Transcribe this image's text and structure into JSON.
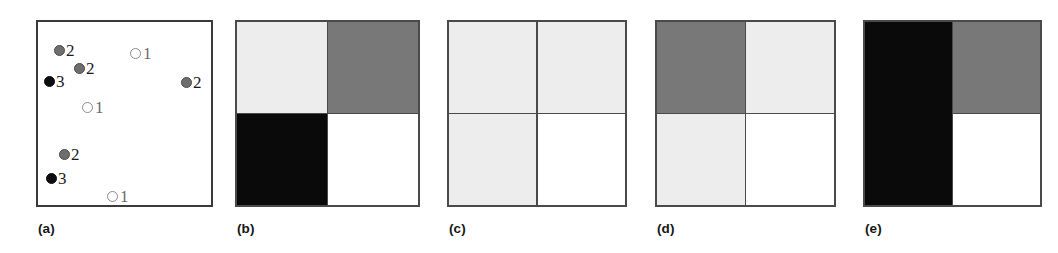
{
  "figure": {
    "panels": [
      {
        "id": "a",
        "caption": "(a)",
        "type": "scatter",
        "points": [
          {
            "label": "2",
            "marker": "gray-filled-circle",
            "x": 16,
            "y": 20
          },
          {
            "label": "1",
            "marker": "hollow-circle",
            "x": 92,
            "y": 23
          },
          {
            "label": "2",
            "marker": "gray-filled-circle",
            "x": 36,
            "y": 38
          },
          {
            "label": "3",
            "marker": "black-filled-circle",
            "x": 6,
            "y": 51
          },
          {
            "label": "2",
            "marker": "gray-filled-circle",
            "x": 143,
            "y": 52
          },
          {
            "label": "1",
            "marker": "hollow-circle",
            "x": 44,
            "y": 77
          },
          {
            "label": "2",
            "marker": "gray-filled-circle",
            "x": 21,
            "y": 124
          },
          {
            "label": "3",
            "marker": "black-filled-circle",
            "x": 8,
            "y": 148
          },
          {
            "label": "1",
            "marker": "hollow-circle",
            "x": 69,
            "y": 166
          }
        ]
      },
      {
        "id": "b",
        "caption": "(b)",
        "type": "quadrant-grid",
        "cells": [
          {
            "position": "top-left",
            "fill": "light-gray",
            "color": "#ededed"
          },
          {
            "position": "top-right",
            "fill": "medium-gray",
            "color": "#787878"
          },
          {
            "position": "bottom-left",
            "fill": "black",
            "color": "#0a0a0a"
          },
          {
            "position": "bottom-right",
            "fill": "white",
            "color": "#ffffff"
          }
        ]
      },
      {
        "id": "c",
        "caption": "(c)",
        "type": "quadrant-grid",
        "cells": [
          {
            "position": "top-left",
            "fill": "light-gray",
            "color": "#ededed"
          },
          {
            "position": "top-right",
            "fill": "light-gray",
            "color": "#ededed"
          },
          {
            "position": "bottom-left",
            "fill": "light-gray",
            "color": "#ededed"
          },
          {
            "position": "bottom-right",
            "fill": "white",
            "color": "#ffffff"
          }
        ]
      },
      {
        "id": "d",
        "caption": "(d)",
        "type": "quadrant-grid",
        "cells": [
          {
            "position": "top-left",
            "fill": "medium-gray",
            "color": "#787878"
          },
          {
            "position": "top-right",
            "fill": "light-gray",
            "color": "#ededed"
          },
          {
            "position": "bottom-left",
            "fill": "light-gray",
            "color": "#ededed"
          },
          {
            "position": "bottom-right",
            "fill": "white",
            "color": "#ffffff"
          }
        ]
      },
      {
        "id": "e",
        "caption": "(e)",
        "type": "quadrant-grid",
        "cells": [
          {
            "position": "left-column-merged",
            "fill": "black",
            "color": "#0a0a0a"
          },
          {
            "position": "top-right",
            "fill": "medium-gray",
            "color": "#787878"
          },
          {
            "position": "bottom-right",
            "fill": "white",
            "color": "#ffffff"
          }
        ]
      }
    ],
    "legend_semantics": {
      "marker_1": "hollow-circle",
      "marker_2": "gray-filled-circle",
      "marker_3": "black-filled-circle"
    },
    "palette": {
      "light_gray": "#ededed",
      "medium_gray": "#787878",
      "black": "#0a0a0a",
      "white": "#ffffff",
      "border": "#4a4a4a"
    }
  }
}
